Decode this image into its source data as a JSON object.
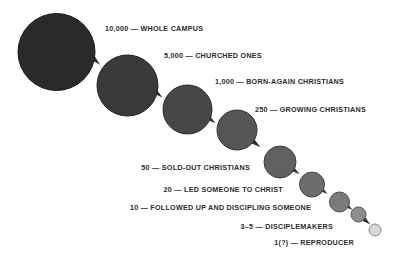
{
  "figure": {
    "background_color": "#ffffff",
    "arrow_color": "#2f2f2f"
  },
  "chart_data": {
    "type": "bubble",
    "title": "",
    "xlabel": "",
    "ylabel": "",
    "categories": [
      "WHOLE CAMPUS",
      "CHURCHED ONES",
      "BORN-AGAIN CHRISTIANS",
      "GROWING CHRISTIANS",
      "SOLD-OUT CHRISTIANS",
      "LED SOMEONE TO CHRIST",
      "FOLLOWED UP AND DISCIPLING SOMEONE",
      "DISCIPLEMAKERS",
      "REPRODUCER"
    ],
    "values": [
      10000,
      5000,
      1000,
      250,
      50,
      20,
      10,
      4,
      1
    ],
    "value_labels": [
      "10,000",
      "5,000",
      "1,000",
      "250",
      "50",
      "20",
      "10",
      "3–5",
      "1(?)"
    ],
    "legend": "none",
    "grid": false
  },
  "nodes": [
    {
      "id": "whole-campus",
      "count": "10,000",
      "name": "WHOLE CAMPUS",
      "label": "10,000 — WHOLE CAMPUS",
      "cx": 56.5,
      "cy": 52,
      "r": 38.5,
      "fill": "#2a2a2a",
      "stroke": "#1a1a1a",
      "label_x": 105,
      "label_y": 24,
      "label_align": "left"
    },
    {
      "id": "churched-ones",
      "count": "5,000",
      "name": "CHURCHED ONES",
      "label": "5,000 — CHURCHED ONES",
      "cx": 127.5,
      "cy": 85.5,
      "r": 30.5,
      "fill": "#3a3a3a",
      "stroke": "#222222",
      "label_x": 164,
      "label_y": 51,
      "label_align": "left"
    },
    {
      "id": "born-again-christians",
      "count": "1,000",
      "name": "BORN-AGAIN CHRISTIANS",
      "label": "1,000 — BORN-AGAIN CHRISTIANS",
      "cx": 187.5,
      "cy": 109.5,
      "r": 24.5,
      "fill": "#474747",
      "stroke": "#2b2b2b",
      "label_x": 215,
      "label_y": 77,
      "label_align": "left"
    },
    {
      "id": "growing-christians",
      "count": "250",
      "name": "GROWING CHRISTIANS",
      "label": "250 — GROWING CHRISTIANS",
      "cx": 237,
      "cy": 130,
      "r": 20,
      "fill": "#555555",
      "stroke": "#333333",
      "label_x": 255,
      "label_y": 105,
      "label_align": "left"
    },
    {
      "id": "sold-out-christians",
      "count": "50",
      "name": "SOLD-OUT CHRISTIANS",
      "label": "50 — SOLD-OUT CHRISTIANS",
      "cx": 280,
      "cy": 162,
      "r": 16,
      "fill": "#616161",
      "stroke": "#3b3b3b",
      "label_x": 250,
      "label_y": 163,
      "label_align": "right"
    },
    {
      "id": "led-someone-to-christ",
      "count": "20",
      "name": "LED SOMEONE TO CHRIST",
      "label": "20 — LED SOMEONE TO CHRIST",
      "cx": 312,
      "cy": 184.5,
      "r": 12.5,
      "fill": "#6d6d6d",
      "stroke": "#454545",
      "label_x": 283,
      "label_y": 185,
      "label_align": "right"
    },
    {
      "id": "followed-up-and-discipling-someone",
      "count": "10",
      "name": "FOLLOWED UP AND DISCIPLING SOMEONE",
      "label": "10 — FOLLOWED UP AND DISCIPLING SOMEONE",
      "cx": 339.5,
      "cy": 202,
      "r": 10,
      "fill": "#7a7a7a",
      "stroke": "#4d4d4d",
      "label_x": 311,
      "label_y": 203,
      "label_align": "right"
    },
    {
      "id": "disciplemakers",
      "count": "3–5",
      "name": "DISCIPLEMAKERS",
      "label": "3–5 — DISCIPLEMAKERS",
      "cx": 358.5,
      "cy": 214.5,
      "r": 7.5,
      "fill": "#8d8d8d",
      "stroke": "#585858",
      "label_x": 333,
      "label_y": 222,
      "label_align": "right"
    },
    {
      "id": "reproducer",
      "count": "1(?)",
      "name": "REPRODUCER",
      "label": "1(?) — REPRODUCER",
      "cx": 375,
      "cy": 230,
      "r": 6,
      "fill": "#d8d8d8",
      "stroke": "#8a8a8a",
      "label_x": 354,
      "label_y": 238,
      "label_align": "right"
    }
  ],
  "connectors": [
    {
      "id": "arrow-1",
      "from": "whole-campus",
      "to": "churched-ones",
      "x": 95,
      "y": 60,
      "angle": 43
    },
    {
      "id": "arrow-2",
      "from": "churched-ones",
      "to": "born-again-christians",
      "x": 157,
      "y": 93,
      "angle": 40
    },
    {
      "id": "arrow-3",
      "from": "born-again-christians",
      "to": "growing-christians",
      "x": 210,
      "y": 119,
      "angle": 38
    },
    {
      "id": "arrow-4",
      "from": "growing-christians",
      "to": "sold-out-christians",
      "x": 255,
      "y": 143,
      "angle": 38
    },
    {
      "id": "arrow-5",
      "from": "sold-out-christians",
      "to": "led-someone-to-christ",
      "x": 294,
      "y": 170,
      "angle": 37
    },
    {
      "id": "arrow-6",
      "from": "led-someone-to-christ",
      "to": "followed-up-and-discipling-someone",
      "x": 322,
      "y": 190,
      "angle": 36
    },
    {
      "id": "arrow-7",
      "from": "followed-up-and-discipling-someone",
      "to": "disciplemakers",
      "x": 347,
      "y": 206,
      "angle": 36
    },
    {
      "id": "arrow-8",
      "from": "disciplemakers",
      "to": "reproducer",
      "x": 365,
      "y": 220,
      "angle": 40
    }
  ]
}
